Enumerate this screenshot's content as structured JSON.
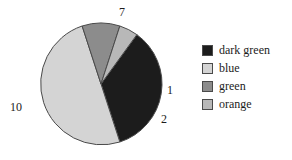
{
  "chart_data": {
    "type": "pie",
    "title": "",
    "categories": [
      "dark green",
      "blue",
      "green",
      "orange"
    ],
    "values": [
      7,
      10,
      2,
      1
    ],
    "total": 20,
    "labels": [
      "7",
      "10",
      "2",
      "1"
    ],
    "colors": [
      "#1c1c1c",
      "#d4d4d4",
      "#8c8c8c",
      "#b8b8b8"
    ],
    "edge_color": "#4a4a4a",
    "legend": {
      "position": "right",
      "entries": [
        {
          "label": "dark green",
          "color": "#1c1c1c",
          "value": 7
        },
        {
          "label": "blue",
          "color": "#d4d4d4",
          "value": 10
        },
        {
          "label": "green",
          "color": "#8c8c8c",
          "value": 2
        },
        {
          "label": "orange",
          "color": "#b8b8b8",
          "value": 1
        }
      ]
    },
    "slice_labels": [
      {
        "text": "7",
        "value": 7,
        "category": "dark green"
      },
      {
        "text": "10",
        "value": 10,
        "category": "blue"
      },
      {
        "text": "2",
        "value": 2,
        "category": "green"
      },
      {
        "text": "1",
        "value": 1,
        "category": "orange"
      }
    ],
    "geometry": {
      "center_x": 101,
      "center_y": 84,
      "radius": 61,
      "start_angle_deg": -54,
      "direction": "clockwise"
    },
    "grid": false,
    "xlabel": "",
    "ylabel": ""
  }
}
